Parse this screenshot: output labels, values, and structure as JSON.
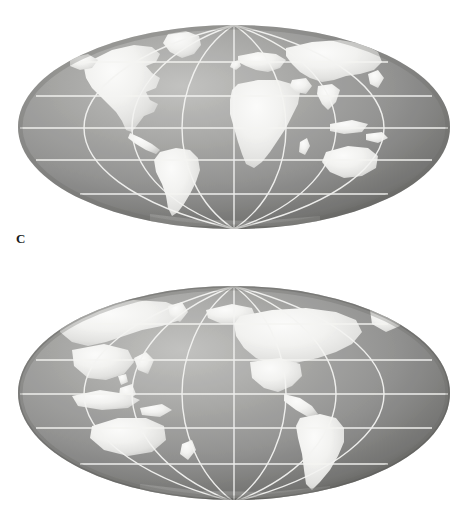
{
  "page": {
    "background_color": "#ffffff",
    "width": 468,
    "height": 532
  },
  "palette": {
    "ocean_light": "#b4b4b2",
    "ocean_mid": "#9a9a98",
    "ocean_dark": "#6e6e6c",
    "ocean_edge": "#5c5c5a",
    "land": "#f2f2f0",
    "land_shadow": "#dcdcda",
    "graticule": "#f4f4f2",
    "label_color": "#1a1a1a",
    "page_background": "#ffffff"
  },
  "figures": [
    {
      "id": "figure-c",
      "label": "C",
      "label_position": "lower-left",
      "projection": "mollweide-sphere",
      "center_longitude": "20E",
      "center_latitude": "0",
      "view_name": "Atlantic / Africa centred hemisphere view",
      "ellipse": {
        "cx": 234,
        "cy": 127,
        "rx": 216,
        "ry": 102
      },
      "graticule": {
        "meridian_interval_deg": 30,
        "parallel_interval_deg": 30,
        "parallels_deg": [
          60,
          30,
          0,
          -30,
          -60
        ],
        "meridians_deg": [
          -90,
          -60,
          -30,
          0,
          30,
          60,
          90
        ],
        "line_color": "#f4f4f2",
        "line_width": 1.4
      },
      "landmasses": [
        "North America",
        "Greenland",
        "South America",
        "Europe",
        "Africa",
        "Asia",
        "Australia",
        "Indonesia",
        "Madagascar",
        "Japan",
        "British Isles",
        "Arabian Peninsula",
        "India"
      ]
    },
    {
      "id": "figure-d",
      "label": "D",
      "label_position": "lower-left",
      "projection": "mollweide-sphere",
      "center_longitude": "160W",
      "center_latitude": "0",
      "view_name": "Pacific centred hemisphere view",
      "ellipse": {
        "cx": 234,
        "cy": 393,
        "rx": 216,
        "ry": 107
      },
      "graticule": {
        "meridian_interval_deg": 30,
        "parallel_interval_deg": 30,
        "parallels_deg": [
          60,
          30,
          0,
          -30,
          -60
        ],
        "meridians_deg": [
          -90,
          -60,
          -30,
          0,
          30,
          60,
          90
        ],
        "line_color": "#f4f4f2",
        "line_width": 1.4
      },
      "landmasses": [
        "North America",
        "Alaska",
        "Central America",
        "South America",
        "Asia",
        "Japan",
        "Australia",
        "Indonesia",
        "Philippines",
        "New Zealand",
        "Pacific Islands"
      ]
    }
  ]
}
